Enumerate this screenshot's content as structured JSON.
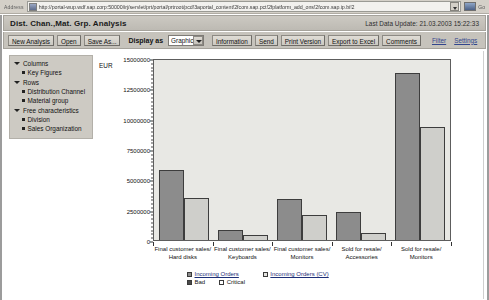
{
  "browser": {
    "address_label": "Address",
    "url": "http://portal-wup.wdf.sap.corp:50000/irj/servlet/prt/portal/prtroot/pcd!3aportal_content!2fcom.sap.pct!2fplatform_add_ons!2fcom.sap.ip.bi!2",
    "go_label": "Go",
    "address_icon": "internet-explorer-icon",
    "dropdown_icon": "chevron-down-icon",
    "go_icon": "go-arrow-icon"
  },
  "header": {
    "title": "Dist. Chan.,Mat. Grp. Analysis",
    "last_update_label": "Last Data Update:",
    "last_update_value": "21.03.2003 15:22:33"
  },
  "toolbar": {
    "new_analysis": "New Analysis",
    "open": "Open",
    "save_as": "Save As...",
    "display_as_label": "Display as",
    "display_as_value": "Graphic",
    "information": "Information",
    "send": "Send",
    "print_version": "Print Version",
    "export_to_excel": "Export to Excel",
    "comments": "Comments",
    "filter_link": "Filter",
    "settings_link": "Settings"
  },
  "sidebar": {
    "groups": [
      {
        "label": "Columns",
        "icon": "triangle-down-icon",
        "children": [
          {
            "label": "Key Figures",
            "icon": "bullet-icon"
          }
        ]
      },
      {
        "label": "Rows",
        "icon": "triangle-down-icon",
        "children": [
          {
            "label": "Distribution Channel",
            "icon": "bullet-icon"
          },
          {
            "label": "Material group",
            "icon": "bullet-icon"
          }
        ]
      },
      {
        "label": "Free characteristics",
        "icon": "triangle-down-icon",
        "children": [
          {
            "label": "Division",
            "icon": "bullet-icon"
          },
          {
            "label": "Sales Organization",
            "icon": "bullet-icon"
          }
        ]
      }
    ]
  },
  "chart_data": {
    "type": "bar",
    "title": "",
    "xlabel": "",
    "ylabel": "EUR",
    "ylim": [
      0,
      15000000
    ],
    "ytick_values": [
      0,
      2500000,
      5000000,
      7500000,
      10000000,
      12500000,
      15000000
    ],
    "ytick_labels": [
      "0",
      "2500000",
      "5000000",
      "7500000",
      "10000000",
      "12500000",
      "15000000"
    ],
    "minor_tick_step": 312500,
    "grid": false,
    "legend_position": "bottom",
    "categories": [
      "Final customer sales/\nHard disks",
      "Final customer sales/\nKeyboards",
      "Final customer sales/\nMonitors",
      "Sold for resale/\nAccessories",
      "Sold for resale/\nMonitors"
    ],
    "category_lines": [
      [
        "Final customer sales/",
        "Hard disks"
      ],
      [
        "Final customer sales/",
        "Keyboards"
      ],
      [
        "Final customer sales/",
        "Monitors"
      ],
      [
        "Sold for resale/",
        "Accessories"
      ],
      [
        "Sold for resale/",
        "Monitors"
      ]
    ],
    "series": [
      {
        "name": "Incoming Orders",
        "color": "#8c8c8c",
        "values": [
          5800000,
          850000,
          3400000,
          2300000,
          13800000
        ]
      },
      {
        "name": "Incoming Orders (CV)",
        "color": "#cfcfcb",
        "values": [
          3500000,
          400000,
          2050000,
          550000,
          9300000
        ]
      }
    ],
    "legend_entries": [
      {
        "label": "Incoming Orders",
        "swatch": "dark",
        "link": true
      },
      {
        "label": "Incoming Orders (CV)",
        "swatch": "light",
        "link": true
      },
      {
        "label": "Bad",
        "swatch": "black",
        "link": false
      },
      {
        "label": "Critical",
        "swatch": "white",
        "link": false
      }
    ]
  }
}
